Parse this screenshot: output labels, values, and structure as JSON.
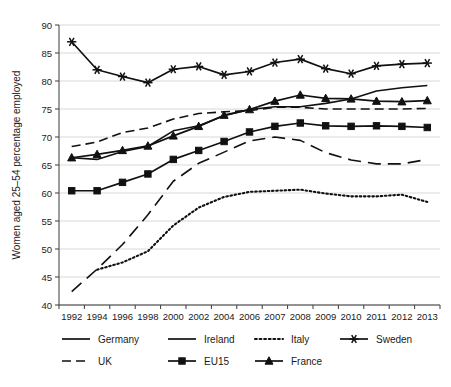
{
  "chart_data": {
    "type": "line",
    "title": "",
    "subtitle": "",
    "xlabel": "",
    "ylabel": "Women aged 25–54  percentage employed",
    "categories": [
      "1992",
      "1994",
      "1996",
      "1998",
      "2000",
      "2002",
      "2004",
      "2006",
      "2007",
      "2008",
      "2009",
      "2010",
      "2011",
      "2012",
      "2013"
    ],
    "ylim": [
      40,
      90
    ],
    "ytick_step": 5,
    "yticks": [
      40,
      45,
      50,
      55,
      60,
      65,
      70,
      75,
      80,
      85,
      90
    ],
    "grid": "horizontal",
    "legend_position": "bottom",
    "series": [
      {
        "name": "Germany",
        "style": "solid",
        "marker": "none",
        "color": "#111111",
        "values": [
          66.3,
          66.0,
          67.4,
          68.3,
          71.1,
          72.0,
          73.8,
          74.9,
          75.4,
          75.4,
          76.0,
          76.8,
          78.2,
          78.8,
          79.2
        ]
      },
      {
        "name": "Ireland",
        "style": "long-dash",
        "marker": "none",
        "color": "#111111",
        "values": [
          42.4,
          46.4,
          50.8,
          56.1,
          62.1,
          65.3,
          67.3,
          69.3,
          70.0,
          69.4,
          67.2,
          65.9,
          65.2,
          65.2,
          66.0
        ]
      },
      {
        "name": "Italy",
        "style": "dotted",
        "marker": "none",
        "color": "#111111",
        "values": [
          null,
          46.3,
          47.6,
          49.6,
          54.2,
          57.4,
          59.3,
          60.2,
          60.4,
          60.6,
          59.9,
          59.4,
          59.4,
          59.7,
          58.4
        ]
      },
      {
        "name": "Sweden",
        "style": "solid",
        "marker": "asterisk",
        "color": "#111111",
        "values": [
          87.0,
          82.0,
          80.8,
          79.7,
          82.1,
          82.6,
          81.1,
          81.7,
          83.3,
          83.9,
          82.2,
          81.3,
          82.7,
          83.0,
          83.2
        ]
      },
      {
        "name": "UK",
        "style": "dash",
        "marker": "none",
        "color": "#111111",
        "values": [
          68.3,
          69.1,
          70.8,
          71.6,
          73.2,
          74.2,
          74.5,
          74.7,
          75.3,
          75.3,
          75.0,
          75.0,
          75.0,
          75.0,
          75.1
        ]
      },
      {
        "name": "EU15",
        "style": "solid",
        "marker": "square",
        "color": "#111111",
        "values": [
          60.4,
          60.4,
          61.9,
          63.4,
          66.0,
          67.6,
          69.2,
          70.9,
          71.9,
          72.5,
          72.0,
          71.9,
          72.0,
          71.9,
          71.7
        ]
      },
      {
        "name": "France",
        "style": "solid",
        "marker": "triangle",
        "color": "#111111",
        "values": [
          66.3,
          66.9,
          67.6,
          68.4,
          70.2,
          71.9,
          73.9,
          74.9,
          76.4,
          77.5,
          76.9,
          76.8,
          76.4,
          76.3,
          76.5
        ]
      }
    ]
  },
  "legend": {
    "entries": [
      {
        "label": "Germany",
        "style": "solid",
        "marker": "none"
      },
      {
        "label": "Ireland",
        "style": "solid",
        "marker": "none"
      },
      {
        "label": "Italy",
        "style": "dotted",
        "marker": "none"
      },
      {
        "label": "Sweden",
        "style": "solid",
        "marker": "asterisk"
      },
      {
        "label": "UK",
        "style": "dash",
        "marker": "none"
      },
      {
        "label": "EU15",
        "style": "solid",
        "marker": "square"
      },
      {
        "label": "France",
        "style": "solid",
        "marker": "triangle"
      }
    ]
  },
  "colors": {
    "ink": "#111111",
    "axis": "#3a3a3a",
    "grid": "#d8d8d8",
    "background": "#ffffff"
  }
}
